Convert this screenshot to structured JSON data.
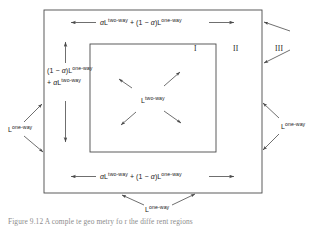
{
  "figure": {
    "type": "schematic-diagram",
    "colors": {
      "background": "#ffffff",
      "line": "#4a4a4a",
      "text": "#1a1a1a",
      "caption_text": "#8d8d8d"
    },
    "boxes": {
      "outer": {
        "name": "region-iii-boundary",
        "x": 44,
        "y": 10,
        "width": 218,
        "height": 183
      },
      "inner": {
        "name": "region-i-boundary",
        "x": 90,
        "y": 44,
        "width": 126,
        "height": 108
      }
    },
    "labels": {
      "top": {
        "name": "top-boundary-label",
        "parts": [
          "αL",
          "two-way",
          " + (1 − α)L",
          "one-way"
        ],
        "plain": "αL^two-way + (1 − α)L^one-way"
      },
      "bottom": {
        "name": "bottom-boundary-label",
        "parts": [
          "αL",
          "two-way",
          " + (1 − α)L",
          "one-way"
        ],
        "plain": "αL^two-way + (1 − α)L^one-way"
      },
      "left_line1": {
        "name": "left-boundary-label-line1",
        "plain": "(1 − α)L^one-way"
      },
      "left_line2": {
        "name": "left-boundary-label-line2",
        "plain": "+ αL^two-way"
      },
      "center": {
        "name": "center-region-label",
        "plain": "L^two-way"
      },
      "left_outer": {
        "name": "left-outer-label",
        "plain": "L^one-way"
      },
      "right_outer": {
        "name": "right-outer-label",
        "plain": "L^one-way"
      },
      "bottom_outer": {
        "name": "bottom-outer-label",
        "plain": "L^one-way"
      },
      "very_bottom": {
        "name": "very-bottom-label",
        "plain": "L^one-way"
      }
    },
    "superscripts": {
      "two_way": "two-way",
      "one_way": "one-way"
    },
    "symbols": {
      "alpha": "α",
      "one_minus_alpha_open": "(1 − ",
      "one_minus_alpha_close": ")L",
      "plus": "+",
      "L": "L"
    },
    "regions": [
      {
        "name": "region-label-i",
        "text": "I",
        "x": 194,
        "y": 45
      },
      {
        "name": "region-label-ii",
        "text": "II",
        "x": 234,
        "y": 45
      },
      {
        "name": "region-label-iii",
        "text": "III",
        "x": 276,
        "y": 45
      }
    ],
    "caption": {
      "name": "figure-caption",
      "text": "Figure 9.12  A comple te geo metry fo r the diffe rent regions"
    }
  }
}
